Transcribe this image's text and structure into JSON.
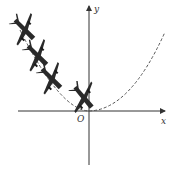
{
  "diagram": {
    "axes": {
      "x_label": "x",
      "y_label": "y",
      "origin_label": "O"
    },
    "curve": {
      "type": "parabola",
      "style": "dashed",
      "vertex": "O"
    },
    "airplane_count": 4,
    "colors": {
      "axis": "#333333",
      "curve": "#555555",
      "airplane": "#2a2a2a"
    }
  }
}
